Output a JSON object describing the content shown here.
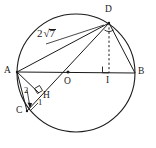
{
  "figure": {
    "stroke_color": "#1a1a1a",
    "background_color": "#ffffff",
    "points": {
      "A": {
        "label": "A",
        "x": 17,
        "y": 72,
        "label_x": 4,
        "label_y": 66
      },
      "B": {
        "label": "B",
        "x": 135,
        "y": 73,
        "label_x": 138,
        "label_y": 67
      },
      "C": {
        "label": "C",
        "x": 27,
        "y": 111,
        "label_x": 16,
        "label_y": 109
      },
      "D": {
        "label": "D",
        "x": 109,
        "y": 23,
        "label_x": 105,
        "label_y": 6
      },
      "O": {
        "label": "O",
        "x": 68,
        "y": 72,
        "label_x": 64,
        "label_y": 76
      },
      "H": {
        "label": "H",
        "x": 38,
        "y": 92,
        "label_x": 43,
        "label_y": 91
      },
      "I": {
        "label": "I",
        "x": 109,
        "y": 73,
        "label_x": 106,
        "label_y": 76
      }
    },
    "measures": {
      "chord_ad": {
        "text": "2",
        "radicand": "7",
        "x": 37,
        "y": 28
      },
      "segment_ac": {
        "text": "2",
        "x": 24,
        "y": 89
      },
      "segment_ch": {
        "text": "1",
        "x": 38,
        "y": 99
      }
    },
    "circle": {
      "cx": 76,
      "cy": 73,
      "r": 59
    },
    "segments": [
      {
        "name": "AB",
        "from": "A",
        "to": "B",
        "style": "solid"
      },
      {
        "name": "AD",
        "from": "A",
        "to": "D",
        "style": "solid"
      },
      {
        "name": "AC",
        "from": "A",
        "to": "C",
        "style": "solid"
      },
      {
        "name": "AH",
        "from": "A",
        "to": "H",
        "style": "solid"
      },
      {
        "name": "DB",
        "from": "D",
        "to": "B",
        "style": "solid"
      },
      {
        "name": "DC",
        "from": "D",
        "to": "C",
        "style": "solid"
      },
      {
        "name": "DI",
        "from": "D",
        "to": "I",
        "style": "dotted"
      }
    ],
    "right_angles": [
      {
        "name": "right-angle-at-H",
        "at": "H"
      },
      {
        "name": "right-angle-at-I",
        "at": "I"
      }
    ],
    "angle_marks": [
      {
        "name": "angle-mark-at-D",
        "at": "D"
      }
    ]
  }
}
